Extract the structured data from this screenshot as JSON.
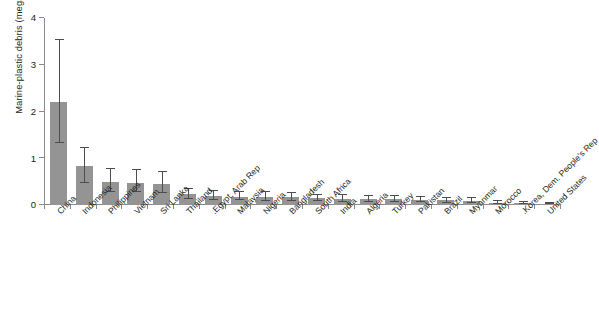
{
  "chart_data": {
    "type": "bar",
    "title": "",
    "subtitle": "",
    "xlabel": "",
    "ylabel": "Marine-plastic debris (megatons per year)",
    "ylim": [
      0,
      4
    ],
    "yticks": [
      0,
      1,
      2,
      3,
      4
    ],
    "ytick_labels": [
      "0",
      "1",
      "2",
      "3",
      "4"
    ],
    "grid": false,
    "legend": null,
    "bar_color": "#949494",
    "error_bar_color": "#4d4d4d",
    "axis_color": "#8a8a8a",
    "error_bars": true,
    "categories": [
      "China",
      "Indonesia",
      "Philippines",
      "Vietnam",
      "Sri Lanka",
      "Thailand",
      "Egypt, Arab Rep.",
      "Malaysia",
      "Nigeria",
      "Bangladesh",
      "South Africa",
      "India",
      "Algeria",
      "Turkey",
      "Pakistan",
      "Brazil",
      "Myanmar",
      "Morocco",
      "Korea, Dem. People's Rep.",
      "United States"
    ],
    "values": [
      2.2,
      0.83,
      0.5,
      0.48,
      0.46,
      0.23,
      0.19,
      0.18,
      0.17,
      0.17,
      0.14,
      0.13,
      0.12,
      0.12,
      0.11,
      0.1,
      0.09,
      0.05,
      0.04,
      0.03
    ],
    "err_low": [
      1.33,
      0.47,
      0.28,
      0.27,
      0.25,
      0.13,
      0.1,
      0.1,
      0.09,
      0.09,
      0.08,
      0.07,
      0.07,
      0.07,
      0.06,
      0.05,
      0.05,
      0.03,
      0.02,
      0.015
    ],
    "err_high": [
      3.53,
      1.21,
      0.78,
      0.74,
      0.71,
      0.35,
      0.29,
      0.28,
      0.27,
      0.26,
      0.22,
      0.21,
      0.19,
      0.19,
      0.17,
      0.16,
      0.14,
      0.08,
      0.07,
      0.05
    ]
  }
}
